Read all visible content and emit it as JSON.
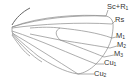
{
  "diagram": {
    "type": "insect wing venation",
    "colors": {
      "vein": "#8a8a8a",
      "costal_edge": "#555555",
      "label": "#333333"
    },
    "labels": [
      {
        "id": "sc-r1",
        "base": "Sc+R",
        "sub": "1",
        "x": 107,
        "y": 6
      },
      {
        "id": "rs",
        "base": "Rs",
        "sub": "",
        "x": 115,
        "y": 18
      },
      {
        "id": "m1",
        "base": "M",
        "sub": "1",
        "x": 116,
        "y": 34
      },
      {
        "id": "m2",
        "base": "M",
        "sub": "2",
        "x": 117,
        "y": 43
      },
      {
        "id": "m3",
        "base": "M",
        "sub": "3",
        "x": 114,
        "y": 52
      },
      {
        "id": "cu1",
        "base": "Cu",
        "sub": "1",
        "x": 104,
        "y": 61
      },
      {
        "id": "cu2",
        "base": "Cu",
        "sub": "2",
        "x": 94,
        "y": 71
      }
    ]
  }
}
